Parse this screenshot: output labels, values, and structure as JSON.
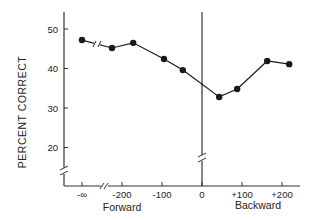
{
  "chart_data": {
    "type": "line",
    "title": "",
    "xlabel": "",
    "ylabel": "PERCENT CORRECT",
    "x_group_labels": [
      {
        "label": "Forward",
        "x_center": -150
      },
      {
        "label": "Backward",
        "x_center": 150
      }
    ],
    "x_ticks": [
      {
        "value": "-inf",
        "label": "-∞"
      },
      {
        "value": -200,
        "label": "-200"
      },
      {
        "value": -100,
        "label": "-100"
      },
      {
        "value": 0,
        "label": "0"
      },
      {
        "value": 100,
        "label": "+100"
      },
      {
        "value": 200,
        "label": "+200"
      }
    ],
    "y_ticks": [
      20,
      30,
      40,
      50
    ],
    "ylim": [
      15,
      55
    ],
    "x_axis_break": true,
    "y_axis_break": true,
    "vertical_reference_line_at_x": 0,
    "grid": false,
    "legend": null,
    "series": [
      {
        "name": "Percent correct",
        "marker": "filled-circle",
        "points": [
          {
            "x": "-inf",
            "y": 47.2
          },
          {
            "x": -225,
            "y": 45.2
          },
          {
            "x": -172,
            "y": 46.5
          },
          {
            "x": -95,
            "y": 42.4
          },
          {
            "x": -48,
            "y": 39.6
          },
          {
            "x": 43,
            "y": 32.8
          },
          {
            "x": 88,
            "y": 34.8
          },
          {
            "x": 163,
            "y": 41.9
          },
          {
            "x": 218,
            "y": 41.1
          }
        ]
      }
    ]
  },
  "labels": {
    "y_axis_title": "PERCENT CORRECT",
    "forward": "Forward",
    "backward": "Backward"
  },
  "colors": {
    "line": "#1a1a1a",
    "axis": "#333333",
    "background": "#ffffff"
  }
}
